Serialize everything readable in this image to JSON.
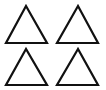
{
  "canvas": {
    "width": 106,
    "height": 90,
    "background": "#ffffff"
  },
  "style": {
    "stroke": "#111111",
    "stroke_width": 2.2
  },
  "shapes": [
    {
      "name": "triangle-top-left",
      "points": [
        [
          26,
          6
        ],
        [
          6,
          43
        ],
        [
          47,
          43
        ]
      ]
    },
    {
      "name": "triangle-top-right",
      "points": [
        [
          78,
          6
        ],
        [
          57,
          43
        ],
        [
          98,
          43
        ]
      ]
    },
    {
      "name": "triangle-bottom-left",
      "points": [
        [
          26,
          49
        ],
        [
          6,
          85
        ],
        [
          47,
          85
        ]
      ]
    },
    {
      "name": "triangle-bottom-right",
      "points": [
        [
          78,
          49
        ],
        [
          57,
          85
        ],
        [
          98,
          85
        ]
      ]
    }
  ]
}
